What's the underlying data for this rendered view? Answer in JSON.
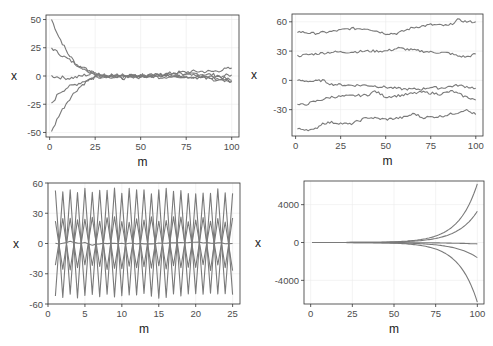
{
  "colors": {
    "line": "#7a7a7a",
    "border": "#333333",
    "grid": "#ebebeb",
    "tick": "#333333",
    "text": "#4d4d4d"
  },
  "chart_data": [
    {
      "id": "panel-top-left",
      "type": "line",
      "title": "",
      "xlabel": "m",
      "ylabel": "x",
      "xlim": [
        -2,
        104
      ],
      "ylim": [
        -54,
        54
      ],
      "xticks": [
        0,
        25,
        50,
        75,
        100
      ],
      "yticks": [
        -50,
        -25,
        0,
        25,
        50
      ],
      "xtick_labels": [
        "0",
        "25",
        "50",
        "75",
        "100"
      ],
      "ytick_labels": [
        "-50",
        "-25",
        "0",
        "25",
        "50"
      ],
      "grid": true,
      "description": "Five series starting at 50, 25, 0, -25, -50 converging to ~0 by m=25, then noisy around 0 up to m=100",
      "series": [
        {
          "name": "start 50",
          "x": [
            1,
            5,
            10,
            15,
            20,
            25,
            30,
            40,
            50,
            60,
            70,
            80,
            90,
            100
          ],
          "y": [
            50,
            35,
            20,
            10,
            5,
            2,
            0,
            1,
            -1,
            1,
            0,
            2,
            1,
            -4
          ]
        },
        {
          "name": "start 25",
          "x": [
            1,
            5,
            10,
            15,
            20,
            25,
            30,
            40,
            50,
            60,
            70,
            80,
            90,
            100
          ],
          "y": [
            25,
            20,
            15,
            10,
            6,
            3,
            1,
            -1,
            1,
            0,
            2,
            0,
            -1,
            1
          ]
        },
        {
          "name": "start 0",
          "x": [
            1,
            5,
            10,
            15,
            20,
            25,
            30,
            40,
            50,
            60,
            70,
            80,
            90,
            100
          ],
          "y": [
            0,
            -1,
            -2,
            -1,
            1,
            2,
            0,
            1,
            0,
            1,
            3,
            4,
            4,
            7
          ]
        },
        {
          "name": "start -25",
          "x": [
            1,
            5,
            10,
            15,
            20,
            25,
            30,
            40,
            50,
            60,
            70,
            80,
            90,
            100
          ],
          "y": [
            -25,
            -15,
            -10,
            -7,
            -4,
            -1,
            0,
            -2,
            1,
            -1,
            0,
            -1,
            -2,
            -5
          ]
        },
        {
          "name": "start -50",
          "x": [
            1,
            5,
            10,
            15,
            20,
            25,
            30,
            40,
            50,
            60,
            70,
            80,
            90,
            100
          ],
          "y": [
            -50,
            -35,
            -22,
            -12,
            -5,
            -1,
            -1,
            0,
            -1,
            1,
            0,
            -1,
            -3,
            -5
          ]
        }
      ]
    },
    {
      "id": "panel-top-right",
      "type": "line",
      "title": "",
      "xlabel": "m",
      "ylabel": "x",
      "xlim": [
        -2,
        104
      ],
      "ylim": [
        -57,
        68
      ],
      "xticks": [
        0,
        25,
        50,
        75,
        100
      ],
      "yticks": [
        -30,
        0,
        30,
        60
      ],
      "xtick_labels": [
        "0",
        "25",
        "50",
        "75",
        "100"
      ],
      "ytick_labels": [
        "-30",
        "0",
        "30",
        "60"
      ],
      "grid": true,
      "description": "Five random-walk series starting at 50, 25, 0, -25, -50 drifting slowly",
      "series": [
        {
          "name": "start 50",
          "x": [
            1,
            10,
            20,
            30,
            40,
            50,
            56,
            65,
            75,
            85,
            90,
            95,
            100
          ],
          "y": [
            50,
            48,
            50,
            53,
            53,
            48,
            48,
            54,
            57,
            56,
            62,
            60,
            60
          ]
        },
        {
          "name": "start 25",
          "x": [
            1,
            10,
            20,
            30,
            40,
            50,
            57,
            65,
            75,
            85,
            90,
            95,
            100
          ],
          "y": [
            25,
            27,
            29,
            29,
            30,
            30,
            33,
            31,
            29,
            28,
            25,
            24,
            27
          ]
        },
        {
          "name": "start 0",
          "x": [
            1,
            10,
            15,
            20,
            30,
            40,
            50,
            60,
            70,
            75,
            80,
            90,
            100
          ],
          "y": [
            0,
            -1,
            0,
            -4,
            -5,
            -5,
            -7,
            -9,
            -9,
            -7,
            -8,
            -5,
            -8
          ]
        },
        {
          "name": "start -25",
          "x": [
            1,
            5,
            10,
            20,
            30,
            40,
            44,
            50,
            60,
            70,
            80,
            87,
            93,
            100
          ],
          "y": [
            -25,
            -25,
            -22,
            -17,
            -16,
            -15,
            -11,
            -17,
            -15,
            -12,
            -14,
            -11,
            -16,
            -20
          ]
        },
        {
          "name": "start -50",
          "x": [
            1,
            5,
            10,
            15,
            20,
            30,
            40,
            50,
            60,
            66,
            70,
            80,
            90,
            94,
            100
          ],
          "y": [
            -50,
            -50,
            -51,
            -44,
            -43,
            -45,
            -38,
            -40,
            -38,
            -34,
            -38,
            -37,
            -33,
            -30,
            -35
          ]
        }
      ]
    },
    {
      "id": "panel-bottom-left",
      "type": "line",
      "title": "",
      "xlabel": "m",
      "ylabel": "x",
      "xlim": [
        0,
        26
      ],
      "ylim": [
        -60,
        60
      ],
      "xticks": [
        0,
        5,
        10,
        15,
        20,
        25
      ],
      "yticks": [
        -60,
        -30,
        0,
        30,
        60
      ],
      "xtick_labels": [
        "0",
        "5",
        "10",
        "15",
        "20",
        "25"
      ],
      "ytick_labels": [
        "-60",
        "-30",
        "0",
        "30",
        "60"
      ],
      "grid": true,
      "description": "Oscillating series alternating sign each step: amplitudes ~50 and ~25, plus a near-zero series",
      "series": [
        {
          "name": "start 50",
          "x_start": 1,
          "x_end": 25,
          "amplitude": 52,
          "alternating": true,
          "sign_start": 1
        },
        {
          "name": "start 25",
          "x_start": 1,
          "x_end": 25,
          "amplitude": 24,
          "alternating": true,
          "sign_start": 1
        },
        {
          "name": "start 0",
          "x": [
            1,
            2,
            3,
            4,
            5,
            6,
            7,
            10,
            15,
            20,
            25
          ],
          "y": [
            0,
            0,
            2,
            0,
            1,
            -2,
            0,
            0,
            0,
            1,
            0
          ]
        },
        {
          "name": "start -25",
          "x_start": 1,
          "x_end": 25,
          "amplitude": 24,
          "alternating": true,
          "sign_start": -1
        },
        {
          "name": "start -50",
          "x_start": 1,
          "x_end": 25,
          "amplitude": 52,
          "alternating": true,
          "sign_start": -1
        }
      ]
    },
    {
      "id": "panel-bottom-right",
      "type": "line",
      "title": "",
      "xlabel": "m",
      "ylabel": "x",
      "xlim": [
        -4,
        104
      ],
      "ylim": [
        -6500,
        6500
      ],
      "xticks": [
        0,
        25,
        50,
        75,
        100
      ],
      "yticks": [
        -4000,
        0,
        4000
      ],
      "xtick_labels": [
        "0",
        "25",
        "50",
        "75",
        "100"
      ],
      "ytick_labels": [
        "-4000",
        "0",
        "4000"
      ],
      "grid": true,
      "description": "Five exponentially diverging series; endpoints approx 6200, 3300, -150, -1600, -6300",
      "series": [
        {
          "name": "series 1",
          "end": 6200
        },
        {
          "name": "series 2",
          "end": 3300
        },
        {
          "name": "series 3",
          "end": -150
        },
        {
          "name": "series 4",
          "end": -1600
        },
        {
          "name": "series 5",
          "end": -6300
        }
      ]
    }
  ],
  "panels_layout": [
    {
      "left": 46,
      "top": 15,
      "right": 239,
      "bottom": 137
    },
    {
      "left": 292,
      "top": 14,
      "right": 483,
      "bottom": 136
    },
    {
      "left": 48,
      "top": 183,
      "right": 240,
      "bottom": 304
    },
    {
      "left": 304,
      "top": 181,
      "right": 484,
      "bottom": 304
    }
  ]
}
